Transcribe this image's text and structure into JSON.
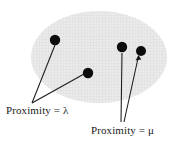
{
  "figure": {
    "type": "diagram",
    "background_color": "#ffffff",
    "region": {
      "name": "proximity-region",
      "shape": "ellipse",
      "fill_color": "#e8e8e8",
      "texture": "crosshatch",
      "texture_color": "#d2d2d2",
      "center_x": 99,
      "center_y": 57,
      "radius_x": 68,
      "radius_y": 46
    },
    "points": [
      {
        "name": "point-lambda-1",
        "x": 55,
        "y": 40,
        "r": 5.2,
        "color": "#0d0d0d",
        "group": "lambda"
      },
      {
        "name": "point-lambda-2",
        "x": 88,
        "y": 73,
        "r": 5.2,
        "color": "#0d0d0d",
        "group": "lambda"
      },
      {
        "name": "point-mu-1",
        "x": 122,
        "y": 47,
        "r": 5.2,
        "color": "#0d0d0d",
        "group": "mu"
      },
      {
        "name": "point-mu-2",
        "x": 141,
        "y": 51,
        "r": 5.0,
        "color": "#0d0d0d",
        "group": "mu"
      }
    ],
    "leaders": [
      {
        "name": "leader-lambda-1",
        "from_x": 32,
        "from_y": 103,
        "to_x": 55,
        "to_y": 45,
        "color": "#1a1a1a"
      },
      {
        "name": "leader-lambda-2",
        "from_x": 32,
        "from_y": 103,
        "to_x": 84,
        "to_y": 74,
        "color": "#1a1a1a"
      },
      {
        "name": "leader-mu-1",
        "from_x": 121,
        "from_y": 122,
        "to_x": 122,
        "to_y": 53,
        "color": "#1a1a1a"
      },
      {
        "name": "leader-mu-2",
        "from_x": 124,
        "from_y": 122,
        "to_x": 138,
        "to_y": 56,
        "color": "#1a1a1a"
      }
    ],
    "labels": {
      "lambda": {
        "prefix": "Proximity",
        "equals": "=",
        "symbol": "λ",
        "full_text": "Proximity = λ"
      },
      "mu": {
        "prefix": "Proximity",
        "equals": "=",
        "symbol": "μ",
        "full_text": "Proximity = μ"
      }
    }
  }
}
